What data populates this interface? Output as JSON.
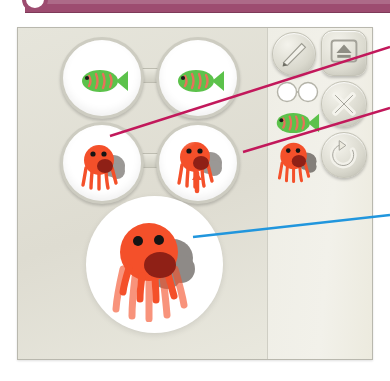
{
  "window": {
    "titlebar_color": "#9d4c70",
    "knob_icon": "circle-knob-icon"
  },
  "panel": {
    "background_color": "#e3e2d8",
    "border_color": "#b9b8ae"
  },
  "stage": {
    "label": "specimen-stage",
    "background_color": "#e6e5db",
    "viewers": [
      {
        "name": "glasses-viewer-top",
        "specimen": "green-fish",
        "specimen_color": "#5cc24b",
        "lens_count": 2,
        "lens_contents": [
          "green-fish",
          "green-fish"
        ]
      },
      {
        "name": "glasses-viewer-bottom",
        "specimen": "orange-octopus",
        "specimen_color": "#f4502a",
        "lens_count": 2,
        "lens_contents": [
          "orange-octopus",
          "orange-octopus"
        ]
      }
    ],
    "magnified_view": {
      "name": "magnified-specimen-circle",
      "specimen": "orange-octopus",
      "specimen_color": "#f4502a",
      "shadow_color": "#5b5550",
      "mouth_color": "#8f2016"
    }
  },
  "toolstrip": {
    "label": "tool-panel",
    "background_color": "#efeee6",
    "buttons": [
      {
        "name": "pencil-button",
        "icon": "pencil-icon",
        "shape": "round"
      },
      {
        "name": "upload-button",
        "icon": "upload-icon",
        "shape": "rounded-square"
      },
      {
        "name": "close-button",
        "icon": "x-icon",
        "shape": "round"
      },
      {
        "name": "rotate-button",
        "icon": "rotate-icon",
        "shape": "round"
      }
    ],
    "thumbnails": [
      {
        "name": "glasses-thumbnail",
        "icon": "glasses-icon",
        "color": "#ffffff"
      },
      {
        "name": "fish-thumbnail",
        "icon": "green-fish-icon",
        "color": "#5cc24b"
      },
      {
        "name": "octopus-thumbnail",
        "icon": "orange-octopus-icon",
        "color": "#f4502a"
      }
    ]
  },
  "annotations": {
    "lines": [
      {
        "name": "callout-line-upper",
        "color": "#c2185b",
        "target": "octopus-left-lens"
      },
      {
        "name": "callout-line-lower",
        "color": "#c2185b",
        "target": "octopus-right-lens"
      },
      {
        "name": "callout-line-blue",
        "color": "#2196dd",
        "target": "magnified-octopus-shadow"
      }
    ]
  }
}
